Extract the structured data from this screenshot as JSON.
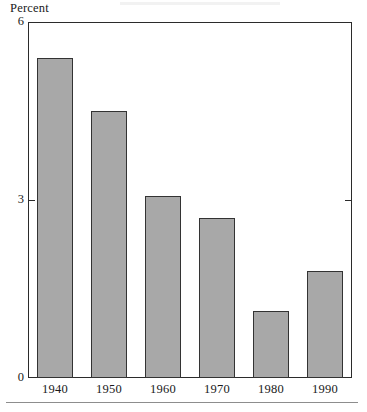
{
  "chart_data": {
    "type": "bar",
    "title": "",
    "subtitle": "",
    "xlabel": "",
    "ylabel": "Percent",
    "categories": [
      "1940",
      "1950",
      "1960",
      "1970",
      "1980",
      "1990"
    ],
    "values": [
      5.4,
      4.5,
      3.07,
      2.7,
      1.13,
      1.8
    ],
    "ylim": [
      0,
      6
    ],
    "yticks": [
      0,
      3,
      6
    ],
    "ytick_labels": [
      "0",
      "3",
      "6"
    ],
    "xlim_categories": 6,
    "grid": false,
    "legend": null,
    "legend_position": "none",
    "annotations": [],
    "series": [
      {
        "name": "Percent",
        "values": [
          5.4,
          4.5,
          3.07,
          2.7,
          1.13,
          1.8
        ]
      }
    ],
    "bar_fill_color": "#a8a8a8",
    "bar_border_color": "#333333",
    "axis_color": "#2b2b2b",
    "background_color": "#ffffff",
    "right_axis_tick_at": 3
  },
  "figure": {
    "axis_title": "Percent"
  }
}
